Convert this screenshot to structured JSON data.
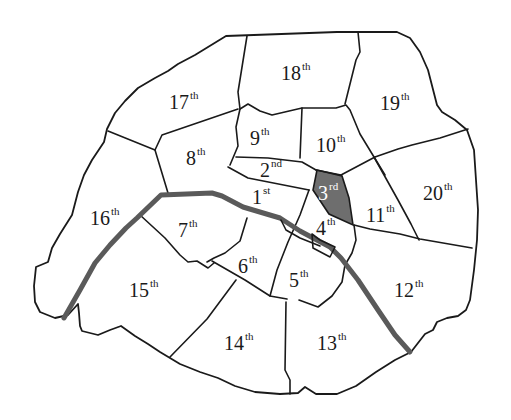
{
  "map": {
    "title": "Paris arrondissements",
    "highlight_color": "#6e6e6e",
    "river_color": "#5a5a5a",
    "highlighted": "3rd",
    "arrondissements": [
      {
        "num": "1",
        "suffix": "st"
      },
      {
        "num": "2",
        "suffix": "nd"
      },
      {
        "num": "3",
        "suffix": "rd"
      },
      {
        "num": "4",
        "suffix": "th"
      },
      {
        "num": "5",
        "suffix": "th"
      },
      {
        "num": "6",
        "suffix": "th"
      },
      {
        "num": "7",
        "suffix": "th"
      },
      {
        "num": "8",
        "suffix": "th"
      },
      {
        "num": "9",
        "suffix": "th"
      },
      {
        "num": "10",
        "suffix": "th"
      },
      {
        "num": "11",
        "suffix": "th"
      },
      {
        "num": "12",
        "suffix": "th"
      },
      {
        "num": "13",
        "suffix": "th"
      },
      {
        "num": "14",
        "suffix": "th"
      },
      {
        "num": "15",
        "suffix": "th"
      },
      {
        "num": "16",
        "suffix": "th"
      },
      {
        "num": "17",
        "suffix": "th"
      },
      {
        "num": "18",
        "suffix": "th"
      },
      {
        "num": "19",
        "suffix": "th"
      },
      {
        "num": "20",
        "suffix": "th"
      }
    ]
  }
}
